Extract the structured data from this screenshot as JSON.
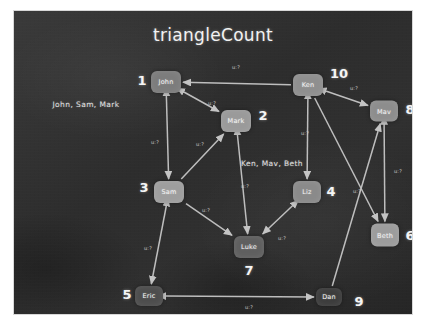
{
  "board": {
    "title": "triangleCount",
    "background_color": "#2f2f2f",
    "chalk_color": "#f2f2f2",
    "frame_color": "#ffffff"
  },
  "annotations": [
    {
      "text": "John, Sam, Mark",
      "x": 72,
      "y": 93
    },
    {
      "text": "Ken, Mav, Beth",
      "x": 258,
      "y": 152
    }
  ],
  "nodes": [
    {
      "id": "john",
      "label": "John",
      "number": "1",
      "x": 152,
      "y": 71,
      "w": 30,
      "h": 22,
      "fill": "#7c7c7c",
      "num_x": 128,
      "num_y": 69
    },
    {
      "id": "mark",
      "label": "Mark",
      "number": "2",
      "x": 222,
      "y": 110,
      "w": 30,
      "h": 22,
      "fill": "#9a9a9a",
      "num_x": 249,
      "num_y": 104
    },
    {
      "id": "sam",
      "label": "Sam",
      "number": "3",
      "x": 155,
      "y": 181,
      "w": 30,
      "h": 22,
      "fill": "#9e9e9e",
      "num_x": 130,
      "num_y": 176
    },
    {
      "id": "liz",
      "label": "Liz",
      "number": "4",
      "x": 293,
      "y": 181,
      "w": 28,
      "h": 22,
      "fill": "#8a8a8a",
      "num_x": 317,
      "num_y": 180
    },
    {
      "id": "eric",
      "label": "Eric",
      "number": "5",
      "x": 135,
      "y": 285,
      "w": 28,
      "h": 20,
      "fill": "#4d4d4d",
      "num_x": 113,
      "num_y": 283
    },
    {
      "id": "beth",
      "label": "Beth",
      "number": "6",
      "x": 371,
      "y": 224,
      "w": 28,
      "h": 23,
      "fill": "#9c9c9c",
      "num_x": 396,
      "num_y": 224
    },
    {
      "id": "luke",
      "label": "Luke",
      "number": "7",
      "x": 235,
      "y": 236,
      "w": 30,
      "h": 22,
      "fill": "#5f5f5f",
      "num_x": 235,
      "num_y": 259
    },
    {
      "id": "mav",
      "label": "Mav",
      "number": "8",
      "x": 370,
      "y": 100,
      "w": 28,
      "h": 21,
      "fill": "#8d8d8d",
      "num_x": 396,
      "num_y": 98
    },
    {
      "id": "dan",
      "label": "Dan",
      "number": "9",
      "x": 315,
      "y": 286,
      "w": 26,
      "h": 18,
      "fill": "#3c3c3c",
      "num_x": 345,
      "num_y": 290
    },
    {
      "id": "ken",
      "label": "Ken",
      "number": "10",
      "x": 294,
      "y": 74,
      "w": 30,
      "h": 22,
      "fill": "#8f8f8f",
      "num_x": 325,
      "num_y": 62
    }
  ],
  "edges": [
    {
      "from": "ken",
      "to": "john",
      "label": "u:?",
      "lx": 222,
      "ly": 56,
      "arrows": "end"
    },
    {
      "from": "john",
      "to": "mark",
      "label": "u:?",
      "lx": 198,
      "ly": 92,
      "arrows": "both"
    },
    {
      "from": "john",
      "to": "sam",
      "label": "u:?",
      "lx": 141,
      "ly": 131,
      "arrows": "both"
    },
    {
      "from": "sam",
      "to": "mark",
      "label": "u:?",
      "lx": 186,
      "ly": 133,
      "arrows": "end"
    },
    {
      "from": "ken",
      "to": "mav",
      "label": "u:?",
      "lx": 340,
      "ly": 77,
      "arrows": "both"
    },
    {
      "from": "ken",
      "to": "liz",
      "label": "u:?",
      "lx": 291,
      "ly": 122,
      "arrows": "both"
    },
    {
      "from": "mark",
      "to": "luke",
      "label": "u:?",
      "lx": 231,
      "ly": 175,
      "arrows": "both"
    },
    {
      "from": "sam",
      "to": "luke",
      "label": "u:?",
      "lx": 192,
      "ly": 199,
      "arrows": "end"
    },
    {
      "from": "liz",
      "to": "luke",
      "label": "u:?",
      "lx": 268,
      "ly": 227,
      "arrows": "both"
    },
    {
      "from": "sam",
      "to": "eric",
      "label": "u:?",
      "lx": 134,
      "ly": 237,
      "arrows": "both"
    },
    {
      "from": "eric",
      "to": "dan",
      "label": "u:?",
      "lx": 235,
      "ly": 296,
      "arrows": "both"
    },
    {
      "from": "mav",
      "to": "beth",
      "label": "u:?",
      "lx": 384,
      "ly": 160,
      "arrows": "both"
    },
    {
      "from": "ken",
      "to": "beth",
      "label": "u:?",
      "lx": 343,
      "ly": 180,
      "arrows": "end"
    },
    {
      "from": "dan",
      "to": "mav",
      "label": "",
      "lx": 0,
      "ly": 0,
      "arrows": "end"
    }
  ]
}
